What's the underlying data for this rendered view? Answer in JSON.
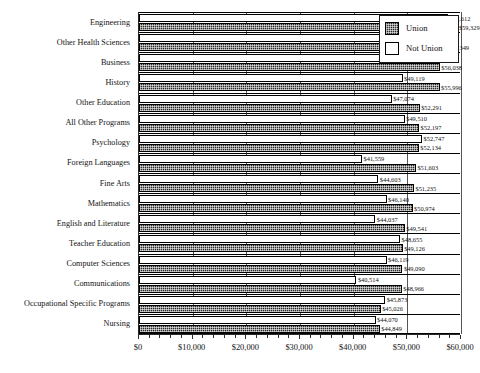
{
  "chart_data": {
    "type": "bar",
    "orientation": "horizontal",
    "title": "",
    "subtitle": "",
    "xlabel": "",
    "ylabel": "",
    "xlim": [
      0,
      60000
    ],
    "grid": true,
    "legend_position": "top-right",
    "categories": [
      "Engineering",
      "Other Health Sciences",
      "Business",
      "History",
      "Other Education",
      "All Other Programs",
      "Psychology",
      "Foreign Languages",
      "Fine Arts",
      "Mathematics",
      "English and Literature",
      "Teacher Education",
      "Computer Sciences",
      "Communications",
      "Occupational Specific Programs",
      "Nursing"
    ],
    "series": [
      {
        "name": "Not Union",
        "values": [
          57612,
          46737,
          52210,
          49119,
          47074,
          49510,
          52747,
          41559,
          44603,
          46140,
          44037,
          48655,
          46119,
          40514,
          45873,
          44070
        ],
        "labels": [
          "$57,612",
          "$46,737",
          "$52,210",
          "$49,119",
          "$47,074",
          "$49,510",
          "$52,747",
          "$41,559",
          "$44,603",
          "$46,140",
          "$44,037",
          "$48,655",
          "$46,119",
          "$40,514",
          "$45,873",
          "$44,070"
        ]
      },
      {
        "name": "Union",
        "values": [
          59329,
          57349,
          56038,
          55996,
          52291,
          52197,
          52134,
          51603,
          51235,
          50974,
          49541,
          49126,
          49090,
          48966,
          45026,
          44849
        ],
        "labels": [
          "$59,329",
          "$57,349",
          "$56,038",
          "$55,996",
          "$52,291",
          "$52,197",
          "$52,134",
          "$51,603",
          "$51,235",
          "$50,974",
          "$49,541",
          "$49,126",
          "$49,090",
          "$48,966",
          "$45,026",
          "$44,849"
        ]
      }
    ],
    "xticks": [
      0,
      10000,
      20000,
      30000,
      40000,
      50000,
      60000
    ],
    "xtick_labels": [
      "$0",
      "$10,000",
      "$20,000",
      "$30,000",
      "$40,000",
      "$50,000",
      "$60,000"
    ]
  },
  "legend": {
    "items": [
      {
        "label": "Union",
        "swatch": "union"
      },
      {
        "label": "Not Union",
        "swatch": "notunion"
      }
    ]
  },
  "colors": {
    "union": "#2b2b2b",
    "not_union": "#ffffff",
    "axis": "#2a2a2a",
    "grid": "#555555",
    "text": "#141414"
  }
}
